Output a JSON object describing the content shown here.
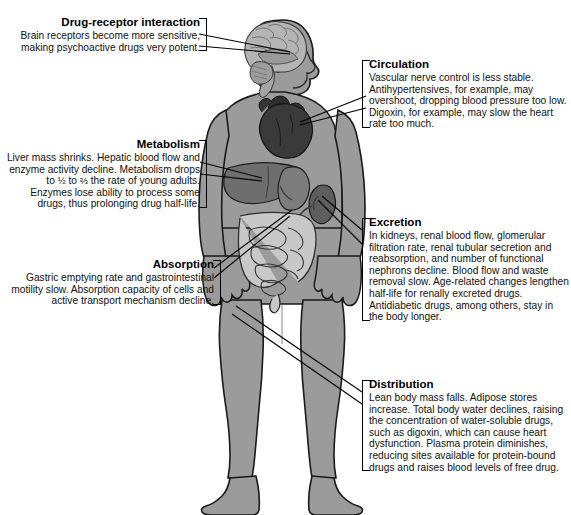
{
  "callouts": [
    {
      "id": "drug-receptor-interaction",
      "title": "Drug-receptor interaction",
      "body": "Brain receptors become more sensitive, making psychoactive drugs very potent.",
      "side": "left",
      "target": "brain"
    },
    {
      "id": "metabolism",
      "title": "Metabolism",
      "body_part_1": "Liver mass shrinks. Hepatic blood flow and enzyme activity decline. Metabolism drops to ",
      "frac_half": "½",
      "body_part_2": " to ",
      "frac_twothirds": "⅔",
      "body_part_3": " the rate of young adults. Enzymes lose ability to process some drugs, thus prolonging drug half-life.",
      "side": "left",
      "target": "liver"
    },
    {
      "id": "absorption",
      "title": "Absorption",
      "body": "Gastric emptying rate and gastrointestinal motility slow. Absorption capacity of cells and active transport mechanism decline.",
      "side": "left",
      "target": "stomach-intestines"
    },
    {
      "id": "circulation",
      "title": "Circulation",
      "body": "Vascular nerve control is less stable. Antihypertensives, for example, may overshoot, dropping blood pressure too low. Digoxin, for example, may slow the heart rate too much.",
      "side": "right",
      "target": "heart"
    },
    {
      "id": "excretion",
      "title": "Excretion",
      "body": "In kidneys, renal blood flow, glomerular filtration rate, renal tubular secretion and reabsorption, and number of functional nephrons decline. Blood flow and waste removal slow. Age-related changes lengthen half-life for renally excreted drugs. Antidiabetic drugs, among others, stay in the body longer.",
      "side": "right",
      "target": "kidneys"
    },
    {
      "id": "distribution",
      "title": "Distribution",
      "body": "Lean body mass falls. Adipose stores increase. Total body water declines, raising the concentration of water-soluble drugs, such as digoxin, which can cause heart dysfunction. Plasma protein diminishes, reducing sites available for protein-bound drugs and raises blood levels of free drug.",
      "side": "right",
      "target": "legs-body-mass"
    }
  ],
  "colors": {
    "body_fill": "#9b9b9b",
    "body_shade": "#8a8a8a",
    "body_outline": "#1a1a1a",
    "brain_fill": "#b0b0b0",
    "heart_fill": "#3a3a3a",
    "liver_fill": "#6e6e6e",
    "kidney_fill": "#5e5e5e",
    "intestine_fill": "#c8c8c8",
    "leader_line": "#000000",
    "background": "#ffffff",
    "text": "#000000"
  }
}
